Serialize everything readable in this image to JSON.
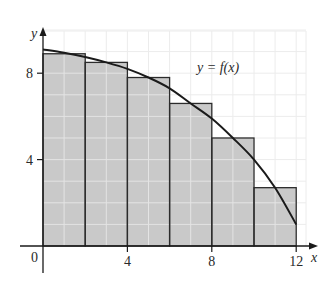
{
  "chart_data": {
    "type": "bar",
    "subtype": "riemann-sum-midpoint",
    "title": "",
    "xlabel": "x",
    "ylabel": "y",
    "curve_label": "y = f(x)",
    "origin_label": "0",
    "x_ticks": [
      4,
      8,
      12
    ],
    "y_ticks": [
      4,
      8
    ],
    "xlim": [
      0,
      12.5
    ],
    "ylim": [
      0,
      10
    ],
    "grid": true,
    "grid_step": 1,
    "categories": [
      "0–2",
      "2–4",
      "4–6",
      "6–8",
      "8–10",
      "10–12"
    ],
    "bars": [
      {
        "x0": 0,
        "x1": 2,
        "height": 8.9
      },
      {
        "x0": 2,
        "x1": 4,
        "height": 8.5
      },
      {
        "x0": 4,
        "x1": 6,
        "height": 7.8
      },
      {
        "x0": 6,
        "x1": 8,
        "height": 6.6
      },
      {
        "x0": 8,
        "x1": 10,
        "height": 5.0
      },
      {
        "x0": 10,
        "x1": 12,
        "height": 2.7
      }
    ],
    "values": [
      8.9,
      8.5,
      7.8,
      6.6,
      5.0,
      2.7
    ],
    "curve": {
      "name": "f(x)",
      "x": [
        0,
        1,
        2,
        3,
        4,
        5,
        6,
        7,
        8,
        9,
        10,
        11,
        12
      ],
      "y": [
        9.1,
        8.95,
        8.75,
        8.5,
        8.2,
        7.8,
        7.3,
        6.6,
        5.9,
        5.0,
        4.0,
        2.7,
        1.0
      ]
    },
    "colors": {
      "bar_fill": "#c9c9c9",
      "bar_stroke": "#2b2b2b",
      "grid_on_bars": "#e4e4e4",
      "grid_background": "#ececec",
      "curve": "#1a1a1a",
      "axis": "#1a1a1a"
    }
  }
}
